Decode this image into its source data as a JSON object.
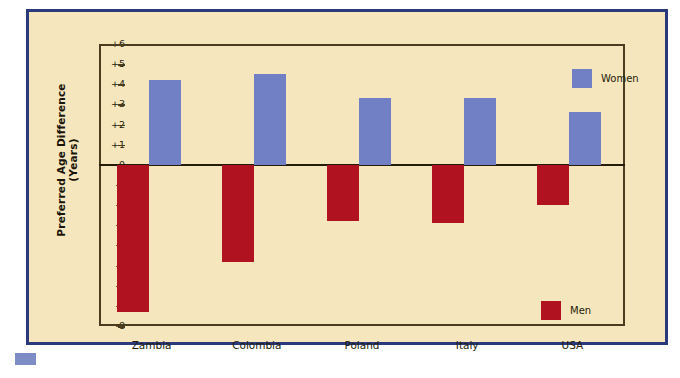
{
  "chart_data": {
    "type": "bar",
    "title": "",
    "xlabel": "",
    "ylabel": "Preferred Age Difference (Years)",
    "categories": [
      "Zambia",
      "Colombia",
      "Poland",
      "Italy",
      "USA"
    ],
    "series": [
      {
        "name": "Women",
        "color": "#7180c4",
        "values": [
          4.2,
          4.5,
          3.3,
          3.3,
          2.6
        ]
      },
      {
        "name": "Men",
        "color": "#b01220",
        "values": [
          -7.3,
          -4.8,
          -2.8,
          -2.9,
          -2.0
        ]
      }
    ],
    "ylim": [
      -8,
      6
    ],
    "yticks": [
      "+6",
      "+5",
      "+4",
      "+3",
      "+2",
      "+1",
      "0",
      "-1",
      "-2",
      "-3",
      "-4",
      "-5",
      "-6",
      "-7",
      "-8"
    ],
    "grid": false,
    "legend_position": "inside-right",
    "zero_line": true
  },
  "colors": {
    "panel_background": "#f6e6bd",
    "panel_border": "#2a3a7c",
    "axis": "#4a3c1e",
    "women": "#7180c4",
    "men": "#b01220",
    "text": "#241c08"
  },
  "legend": [
    {
      "label": "Women",
      "color": "#7180c4"
    },
    {
      "label": "Men",
      "color": "#b01220"
    }
  ]
}
